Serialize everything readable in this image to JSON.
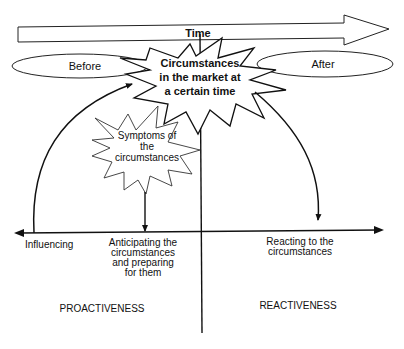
{
  "diagram": {
    "time_arrow": {
      "label": "Time"
    },
    "before": {
      "label": "Before"
    },
    "after": {
      "label": "After"
    },
    "central_event": {
      "lines": [
        "Circumstances",
        "in the market at",
        "a certain time"
      ]
    },
    "symptoms": {
      "lines": [
        "Symptoms of",
        "the",
        "circumstances"
      ]
    },
    "axis_labels": {
      "influencing": "Influencing",
      "anticipating": [
        "Anticipating the",
        "circumstances",
        "and preparing",
        "for them"
      ],
      "reacting": [
        "Reacting to the",
        "circumstances"
      ]
    },
    "regions": {
      "proactiveness": "PROACTIVENESS",
      "reactiveness": "REACTIVENESS"
    },
    "colors": {
      "stroke": "#111111",
      "background": "#ffffff"
    }
  }
}
